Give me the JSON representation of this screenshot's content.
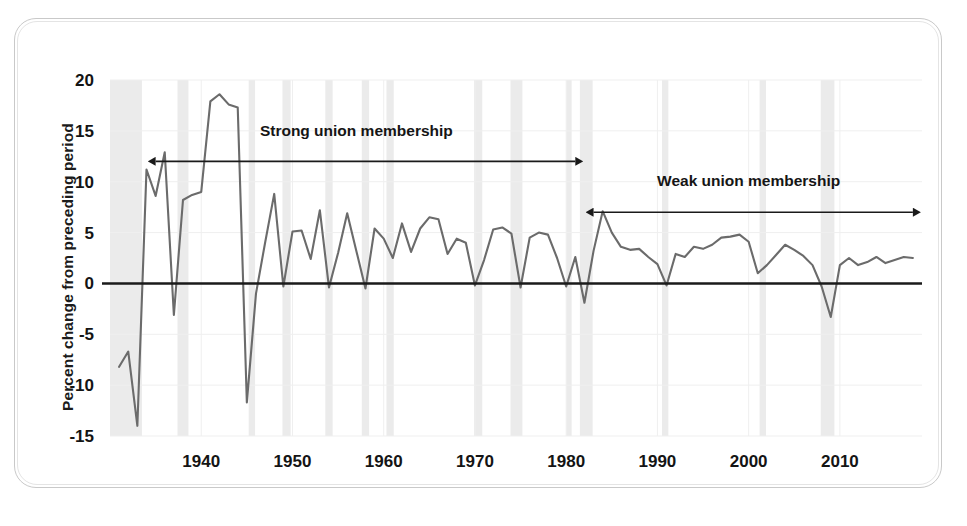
{
  "figure": {
    "frame_color": "#c9c9c9",
    "background": "#ffffff"
  },
  "chart_data": {
    "type": "line",
    "title": "",
    "subtitle": "",
    "xlabel": "",
    "ylabel": "Percent change from preceding period",
    "xlim": [
      1930,
      2019
    ],
    "ylim": [
      -15,
      20
    ],
    "yticks": [
      -15,
      -10,
      -5,
      0,
      5,
      10,
      15,
      20
    ],
    "ytick_labels": [
      "-15",
      "-10",
      "-5",
      "0",
      "5",
      "10",
      "15",
      "20"
    ],
    "xticks": [
      1940,
      1950,
      1960,
      1970,
      1980,
      1990,
      2000,
      2010
    ],
    "xtick_labels": [
      "1940",
      "1950",
      "1960",
      "1970",
      "1980",
      "1990",
      "2000",
      "2010"
    ],
    "grid": true,
    "grid_color": "#efefef",
    "legend": null,
    "line_color": "#6b6b6b",
    "zero_line_color": "#1a1a1a",
    "series": [
      {
        "name": "Percent change from preceding period",
        "x": [
          1931,
          1932,
          1933,
          1934,
          1935,
          1936,
          1937,
          1938,
          1939,
          1940,
          1941,
          1942,
          1943,
          1944,
          1945,
          1946,
          1947,
          1948,
          1949,
          1950,
          1951,
          1952,
          1953,
          1954,
          1955,
          1956,
          1957,
          1958,
          1959,
          1960,
          1961,
          1962,
          1963,
          1964,
          1965,
          1966,
          1967,
          1968,
          1969,
          1970,
          1971,
          1972,
          1973,
          1974,
          1975,
          1976,
          1977,
          1978,
          1979,
          1980,
          1981,
          1982,
          1983,
          1984,
          1985,
          1986,
          1987,
          1988,
          1989,
          1990,
          1991,
          1992,
          1993,
          1994,
          1995,
          1996,
          1997,
          1998,
          1999,
          2000,
          2001,
          2002,
          2003,
          2004,
          2005,
          2006,
          2007,
          2008,
          2009,
          2010,
          2011,
          2012,
          2013,
          2014,
          2015,
          2016,
          2017,
          2018
        ],
        "y": [
          -8.2,
          -6.7,
          -14.0,
          11.2,
          8.6,
          12.9,
          -3.1,
          8.2,
          8.7,
          9.0,
          17.9,
          18.6,
          17.6,
          17.3,
          -11.7,
          -1.0,
          4.0,
          8.8,
          -0.3,
          5.1,
          5.2,
          2.4,
          7.2,
          -0.4,
          3.0,
          6.9,
          3.2,
          -0.5,
          5.4,
          4.4,
          2.5,
          5.9,
          3.1,
          5.4,
          6.5,
          6.3,
          2.9,
          4.4,
          4.0,
          -0.2,
          2.3,
          5.3,
          5.5,
          4.9,
          -0.4,
          4.5,
          5.0,
          4.8,
          2.5,
          -0.3,
          2.6,
          -1.9,
          3.2,
          7.1,
          5.0,
          3.6,
          3.3,
          3.4,
          2.6,
          1.9,
          -0.2,
          2.9,
          2.6,
          3.6,
          3.4,
          3.8,
          4.5,
          4.6,
          4.8,
          4.1,
          1.0,
          1.8,
          2.8,
          3.8,
          3.3,
          2.7,
          1.8,
          -0.3,
          -3.3,
          1.8,
          2.5,
          1.8,
          2.1,
          2.6,
          2.0,
          2.3,
          2.6,
          2.5
        ]
      }
    ],
    "shaded_bands": {
      "name": "recession-bands",
      "color": "#ebebeb",
      "ranges": [
        [
          1930.0,
          1933.5
        ],
        [
          1937.4,
          1938.6
        ],
        [
          1945.2,
          1945.9
        ],
        [
          1948.9,
          1949.8
        ],
        [
          1953.6,
          1954.4
        ],
        [
          1957.6,
          1958.4
        ],
        [
          1960.3,
          1961.1
        ],
        [
          1969.9,
          1970.8
        ],
        [
          1973.9,
          1975.2
        ],
        [
          1980.0,
          1980.6
        ],
        [
          1981.5,
          1982.9
        ],
        [
          1990.5,
          1991.2
        ],
        [
          2001.2,
          2001.9
        ],
        [
          2007.9,
          2009.4
        ]
      ]
    },
    "annotations": [
      {
        "id": "strong-union-annotation",
        "label": "Strong union membership",
        "x_start": 1935,
        "x_end": 1981,
        "y": 12,
        "arrow_style": "left-head",
        "text_x": 1957,
        "text_y": 14.5
      },
      {
        "id": "weak-union-annotation",
        "label": "Weak union membership",
        "x_start": 1983,
        "x_end": 2018,
        "y": 7,
        "arrow_style": "double-head",
        "text_x": 2000,
        "text_y": 9.6
      }
    ]
  }
}
